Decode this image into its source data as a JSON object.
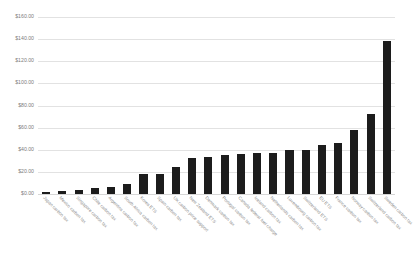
{
  "chart_data": {
    "type": "bar",
    "title": "",
    "subtitle": "",
    "xlabel": "",
    "ylabel": "",
    "ylim": [
      0,
      160
    ],
    "grid": true,
    "legend": "none",
    "bar_color": "#1c1c1c",
    "gridline_color": "#e2e2e2",
    "background_color": "#ffffff",
    "axis_label_color": "#7d7d7d",
    "y_tick_labels": [
      "$160.00",
      "$140.00",
      "$120.00",
      "$100.00",
      "$80.00",
      "$60.00",
      "$40.00",
      "$20.00",
      "$0.00"
    ],
    "y_tick_values": [
      160,
      140,
      120,
      100,
      80,
      60,
      40,
      20,
      0
    ],
    "categories": [
      "Japan carbon tax",
      "Mexico carbon tax",
      "Singapore carbon tax",
      "Chile carbon tax",
      "Argentina carbon tax",
      "South Africa carbon tax",
      "Korea ETS",
      "Spain carbon tax",
      "UK carbon price support",
      "New Zealand ETS",
      "Denmark carbon tax",
      "Portugal carbon tax",
      "Canada federal fuel charge",
      "Iceland carbon tax",
      "Netherlands carbon tax",
      "Luxembourg carbon tax",
      "Switzerland ETS",
      "EU ETS",
      "France carbon tax",
      "Norway carbon tax",
      "Switzerland carbon tax",
      "Sweden carbon tax"
    ],
    "values": [
      2.0,
      3.0,
      4.0,
      5.0,
      6.0,
      9.0,
      18.0,
      18.5,
      24.0,
      33.0,
      33.5,
      35.0,
      36.0,
      37.0,
      37.5,
      39.5,
      40.0,
      44.0,
      46.0,
      58.0,
      72.0,
      138.0
    ]
  }
}
